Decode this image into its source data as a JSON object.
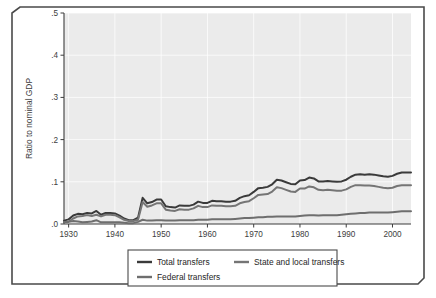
{
  "figure": {
    "background_color": "#ffffff",
    "frame_color": "#4a4a4a",
    "frame_bevel": "clipped-corners"
  },
  "chart_data": {
    "type": "line",
    "title": "",
    "subtitle": "",
    "xlabel": "",
    "ylabel": "Ratio to nominal GDP",
    "xlim": [
      1929,
      2004
    ],
    "ylim": [
      0.0,
      0.5
    ],
    "xticks": [
      1930,
      1940,
      1950,
      1960,
      1970,
      1980,
      1990,
      2000
    ],
    "xtick_labels": [
      "1930",
      "1940",
      "1950",
      "1960",
      "1970",
      "1980",
      "1990",
      "2000"
    ],
    "yticks": [
      0.0,
      0.1,
      0.2,
      0.3,
      0.4,
      0.5
    ],
    "ytick_labels": [
      ".0",
      ".1",
      ".2",
      ".3",
      ".4",
      ".5"
    ],
    "grid": true,
    "grid_color": "#ffffff",
    "plot_background": "#ebebeb",
    "legend_position": "below-axes",
    "x": [
      1929,
      1930,
      1931,
      1932,
      1933,
      1934,
      1935,
      1936,
      1937,
      1938,
      1939,
      1940,
      1941,
      1942,
      1943,
      1944,
      1945,
      1946,
      1947,
      1948,
      1949,
      1950,
      1951,
      1952,
      1953,
      1954,
      1955,
      1956,
      1957,
      1958,
      1959,
      1960,
      1961,
      1962,
      1963,
      1964,
      1965,
      1966,
      1967,
      1968,
      1969,
      1970,
      1971,
      1972,
      1973,
      1974,
      1975,
      1976,
      1977,
      1978,
      1979,
      1980,
      1981,
      1982,
      1983,
      1984,
      1985,
      1986,
      1987,
      1988,
      1989,
      1990,
      1991,
      1992,
      1993,
      1994,
      1995,
      1996,
      1997,
      1998,
      1999,
      2000,
      2001,
      2002,
      2003,
      2004
    ],
    "series": [
      {
        "name": "Total transfers",
        "color": "#3a3a3a",
        "width": 2.0,
        "values": [
          0.008,
          0.011,
          0.02,
          0.024,
          0.023,
          0.026,
          0.025,
          0.031,
          0.022,
          0.026,
          0.026,
          0.025,
          0.02,
          0.013,
          0.009,
          0.009,
          0.015,
          0.062,
          0.049,
          0.052,
          0.058,
          0.058,
          0.042,
          0.04,
          0.039,
          0.044,
          0.043,
          0.043,
          0.046,
          0.053,
          0.05,
          0.05,
          0.055,
          0.054,
          0.054,
          0.053,
          0.053,
          0.055,
          0.062,
          0.066,
          0.068,
          0.076,
          0.085,
          0.086,
          0.088,
          0.094,
          0.105,
          0.103,
          0.099,
          0.095,
          0.094,
          0.103,
          0.104,
          0.11,
          0.108,
          0.101,
          0.101,
          0.102,
          0.101,
          0.1,
          0.101,
          0.105,
          0.112,
          0.117,
          0.118,
          0.117,
          0.118,
          0.117,
          0.115,
          0.113,
          0.112,
          0.114,
          0.119,
          0.122,
          0.122,
          0.122
        ]
      },
      {
        "name": "State and local transfers",
        "color": "#757575",
        "width": 2.0,
        "values": [
          0.004,
          0.006,
          0.013,
          0.018,
          0.019,
          0.021,
          0.019,
          0.022,
          0.018,
          0.022,
          0.022,
          0.021,
          0.016,
          0.01,
          0.007,
          0.007,
          0.01,
          0.052,
          0.041,
          0.044,
          0.049,
          0.049,
          0.034,
          0.032,
          0.031,
          0.035,
          0.034,
          0.034,
          0.037,
          0.043,
          0.04,
          0.04,
          0.044,
          0.043,
          0.043,
          0.042,
          0.042,
          0.043,
          0.049,
          0.052,
          0.054,
          0.061,
          0.069,
          0.07,
          0.071,
          0.077,
          0.087,
          0.085,
          0.081,
          0.077,
          0.076,
          0.084,
          0.084,
          0.089,
          0.087,
          0.081,
          0.08,
          0.081,
          0.08,
          0.079,
          0.079,
          0.082,
          0.088,
          0.092,
          0.092,
          0.091,
          0.091,
          0.09,
          0.088,
          0.086,
          0.085,
          0.086,
          0.09,
          0.092,
          0.092,
          0.092
        ]
      },
      {
        "name": "Federal transfers",
        "color": "#6e6e6e",
        "width": 2.0,
        "values": [
          0.004,
          0.005,
          0.007,
          0.006,
          0.004,
          0.005,
          0.006,
          0.009,
          0.004,
          0.004,
          0.004,
          0.004,
          0.004,
          0.003,
          0.002,
          0.002,
          0.005,
          0.01,
          0.008,
          0.008,
          0.009,
          0.009,
          0.008,
          0.008,
          0.008,
          0.009,
          0.009,
          0.009,
          0.009,
          0.01,
          0.01,
          0.01,
          0.011,
          0.011,
          0.011,
          0.011,
          0.011,
          0.012,
          0.013,
          0.014,
          0.014,
          0.015,
          0.016,
          0.016,
          0.017,
          0.017,
          0.018,
          0.018,
          0.018,
          0.018,
          0.018,
          0.019,
          0.02,
          0.021,
          0.021,
          0.02,
          0.021,
          0.021,
          0.021,
          0.021,
          0.022,
          0.023,
          0.024,
          0.025,
          0.026,
          0.026,
          0.027,
          0.027,
          0.027,
          0.027,
          0.027,
          0.028,
          0.029,
          0.03,
          0.03,
          0.03
        ]
      }
    ]
  },
  "legend": {
    "entries": [
      {
        "label": "Total transfers",
        "color": "#3a3a3a"
      },
      {
        "label": "State and local transfers",
        "color": "#757575"
      },
      {
        "label": "Federal transfers",
        "color": "#6e6e6e"
      }
    ],
    "border_color": "#4a4a4a"
  }
}
